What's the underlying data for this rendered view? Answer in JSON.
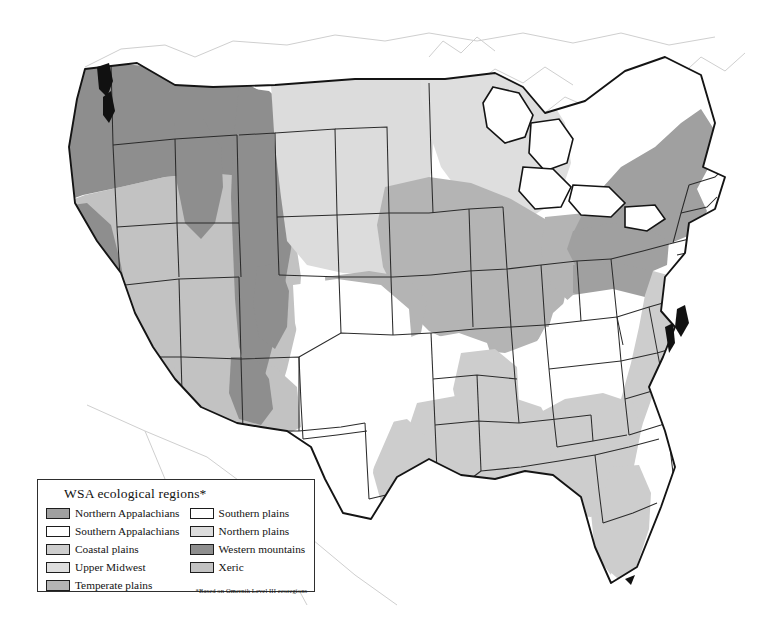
{
  "figure": {
    "kind": "choropleth-map",
    "projection_note": "Albers-style conterminous US outline with state boundaries"
  },
  "legend": {
    "title": "WSA ecological regions*",
    "note": "*Based on Omernik Level III ecoregions",
    "left_column": [
      {
        "label": "Northern Appalachians",
        "color": "#a0a0a0",
        "key": "northern-appalachians"
      },
      {
        "label": "Southern Appalachians",
        "color": "#ffffff",
        "key": "southern-appalachians"
      },
      {
        "label": "Coastal plains",
        "color": "#cdcdcd",
        "key": "coastal-plains"
      },
      {
        "label": "Upper Midwest",
        "color": "#dedede",
        "key": "upper-midwest"
      },
      {
        "label": "Temperate plains",
        "color": "#b4b4b4",
        "key": "temperate-plains"
      }
    ],
    "right_column": [
      {
        "label": "Southern plains",
        "color": "#ffffff",
        "key": "southern-plains"
      },
      {
        "label": "Northern plains",
        "color": "#dcdcdc",
        "key": "northern-plains"
      },
      {
        "label": "Western mountains",
        "color": "#8e8e8e",
        "key": "western-mountains"
      },
      {
        "label": "Xeric",
        "color": "#c2c2c2",
        "key": "xeric"
      }
    ]
  },
  "map_data": {
    "type": "choropleth",
    "regions": [
      {
        "key": "northern-appalachians",
        "label": "Northern Appalachians",
        "color": "#a0a0a0",
        "extent": "New England, New York, northern Pennsylvania, northern Michigan fringe"
      },
      {
        "key": "southern-appalachians",
        "label": "Southern Appalachians",
        "color": "#ffffff",
        "extent": "Central Pennsylvania, West Virginia, Kentucky, Tennessee, western Carolinas, northern Georgia, Ozarks"
      },
      {
        "key": "coastal-plains",
        "label": "Coastal plains",
        "color": "#cdcdcd",
        "extent": "Atlantic seaboard from New Jersey to Florida, Gulf coast to east Texas, Mississippi embayment"
      },
      {
        "key": "upper-midwest",
        "label": "Upper Midwest",
        "color": "#dedede",
        "extent": "Michigan, Wisconsin, northern Minnesota"
      },
      {
        "key": "temperate-plains",
        "label": "Temperate plains",
        "color": "#b4b4b4",
        "extent": "Iowa, Illinois, Indiana, Ohio, Missouri, eastern Kansas and Nebraska"
      },
      {
        "key": "southern-plains",
        "label": "Southern plains",
        "color": "#ffffff",
        "extent": "Texas, Oklahoma, southern Kansas, eastern New Mexico"
      },
      {
        "key": "northern-plains",
        "label": "Northern plains",
        "color": "#dcdcdc",
        "extent": "North Dakota, South Dakota, Nebraska, eastern Montana"
      },
      {
        "key": "western-mountains",
        "label": "Western mountains",
        "color": "#8e8e8e",
        "extent": "Cascades, Sierra Nevada, Northern and Southern Rockies, Idaho, western Montana"
      },
      {
        "key": "xeric",
        "label": "Xeric",
        "color": "#c2c2c2",
        "extent": "Great Basin, Colorado Plateau, Arizona, Nevada, Utah, central California valley"
      }
    ],
    "boundaries": {
      "state_line_color": "#2b2b2b",
      "coastline_color": "#111111",
      "neighbor_country_color": "#c8c8c8",
      "background": "#ffffff"
    }
  }
}
